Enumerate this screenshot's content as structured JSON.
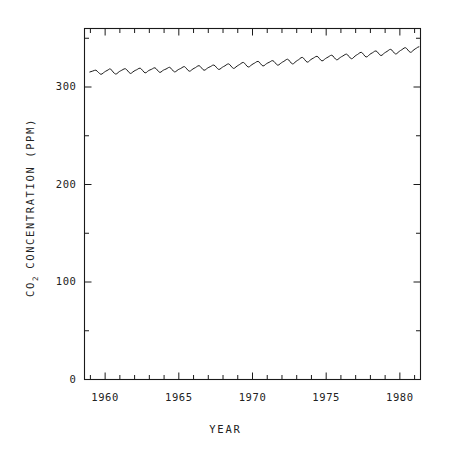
{
  "figure": {
    "background_color": "#ffffff",
    "line_color": "#1a1a1a",
    "frame_color": "#1a1a1a"
  },
  "axis_titles": {
    "y_prefix": "CO",
    "y_subscript": "2",
    "y_suffix": " CONCENTRATION  (PPM)",
    "x": "YEAR"
  },
  "y_ticks": [
    {
      "label": "0",
      "value": 0
    },
    {
      "label": "100",
      "value": 100
    },
    {
      "label": "200",
      "value": 200
    },
    {
      "label": "300",
      "value": 300
    }
  ],
  "y_minor_values": [
    50,
    150,
    250,
    350
  ],
  "x_ticks": [
    {
      "label": "1960",
      "value": 1960
    },
    {
      "label": "1965",
      "value": 1965
    },
    {
      "label": "1970",
      "value": 1970
    },
    {
      "label": "1975",
      "value": 1975
    },
    {
      "label": "1980",
      "value": 1980
    }
  ],
  "x_minor_values": [
    1959,
    1961,
    1962,
    1963,
    1964,
    1966,
    1967,
    1968,
    1969,
    1971,
    1972,
    1973,
    1974,
    1976,
    1977,
    1978,
    1979,
    1981
  ],
  "chart_data": {
    "type": "line",
    "title": "",
    "xlabel": "YEAR",
    "ylabel": "CO2 CONCENTRATION (PPM)",
    "xlim": [
      1958.6,
      1981.4
    ],
    "ylim": [
      0,
      360
    ],
    "grid": false,
    "legend": null,
    "series": [
      {
        "name": "Atmospheric CO2 (Mauna Loa monthly mean)",
        "note": "Monthly mean CO2 concentration showing rising trend with annual seasonal oscillation (~6 ppm peak-to-peak)",
        "x": [
          1958.96,
          1959.13,
          1959.29,
          1959.38,
          1959.46,
          1959.54,
          1959.63,
          1959.71,
          1959.79,
          1959.88,
          1959.96,
          1960.04,
          1960.13,
          1960.21,
          1960.29,
          1960.38,
          1960.46,
          1960.54,
          1960.63,
          1960.71,
          1960.79,
          1960.88,
          1960.96,
          1961.04,
          1961.13,
          1961.21,
          1961.29,
          1961.38,
          1961.46,
          1961.54,
          1961.63,
          1961.71,
          1961.79,
          1961.88,
          1961.96,
          1962.04,
          1962.13,
          1962.21,
          1962.29,
          1962.38,
          1962.46,
          1962.54,
          1962.63,
          1962.71,
          1962.79,
          1962.88,
          1962.96,
          1963.04,
          1963.13,
          1963.21,
          1963.29,
          1963.38,
          1963.46,
          1963.54,
          1963.63,
          1963.71,
          1963.79,
          1963.88,
          1963.96,
          1964.04,
          1964.13,
          1964.21,
          1964.29,
          1964.38,
          1964.46,
          1964.54,
          1964.63,
          1964.71,
          1964.79,
          1964.88,
          1964.96,
          1965.04,
          1965.13,
          1965.21,
          1965.29,
          1965.38,
          1965.46,
          1965.54,
          1965.63,
          1965.71,
          1965.79,
          1965.88,
          1965.96,
          1966.04,
          1966.13,
          1966.21,
          1966.29,
          1966.38,
          1966.46,
          1966.54,
          1966.63,
          1966.71,
          1966.79,
          1966.88,
          1966.96,
          1967.04,
          1967.13,
          1967.21,
          1967.29,
          1967.38,
          1967.46,
          1967.54,
          1967.63,
          1967.71,
          1967.79,
          1967.88,
          1967.96,
          1968.04,
          1968.13,
          1968.21,
          1968.29,
          1968.38,
          1968.46,
          1968.54,
          1968.63,
          1968.71,
          1968.79,
          1968.88,
          1968.96,
          1969.04,
          1969.13,
          1969.21,
          1969.29,
          1969.38,
          1969.46,
          1969.54,
          1969.63,
          1969.71,
          1969.79,
          1969.88,
          1969.96,
          1970.04,
          1970.13,
          1970.21,
          1970.29,
          1970.38,
          1970.46,
          1970.54,
          1970.63,
          1970.71,
          1970.79,
          1970.88,
          1970.96,
          1971.04,
          1971.13,
          1971.21,
          1971.29,
          1971.38,
          1971.46,
          1971.54,
          1971.63,
          1971.71,
          1971.79,
          1971.88,
          1971.96,
          1972.04,
          1972.13,
          1972.21,
          1972.29,
          1972.38,
          1972.46,
          1972.54,
          1972.63,
          1972.71,
          1972.79,
          1972.88,
          1972.96,
          1973.04,
          1973.13,
          1973.21,
          1973.29,
          1973.38,
          1973.46,
          1973.54,
          1973.63,
          1973.71,
          1973.79,
          1973.88,
          1973.96,
          1974.04,
          1974.13,
          1974.21,
          1974.29,
          1974.38,
          1974.46,
          1974.54,
          1974.63,
          1974.71,
          1974.79,
          1974.88,
          1974.96,
          1975.04,
          1975.13,
          1975.21,
          1975.29,
          1975.38,
          1975.46,
          1975.54,
          1975.63,
          1975.71,
          1975.79,
          1975.88,
          1975.96,
          1976.04,
          1976.13,
          1976.21,
          1976.29,
          1976.38,
          1976.46,
          1976.54,
          1976.63,
          1976.71,
          1976.79,
          1976.88,
          1976.96,
          1977.04,
          1977.13,
          1977.21,
          1977.29,
          1977.38,
          1977.46,
          1977.54,
          1977.63,
          1977.71,
          1977.79,
          1977.88,
          1977.96,
          1978.04,
          1978.13,
          1978.21,
          1978.29,
          1978.38,
          1978.46,
          1978.54,
          1978.63,
          1978.71,
          1978.79,
          1978.88,
          1978.96,
          1979.04,
          1979.13,
          1979.21,
          1979.29,
          1979.38,
          1979.46,
          1979.54,
          1979.63,
          1979.71,
          1979.79,
          1979.88,
          1979.96,
          1980.04,
          1980.13,
          1980.21,
          1980.29,
          1980.38,
          1980.46,
          1980.54,
          1980.63,
          1980.71,
          1980.79,
          1980.88,
          1980.96,
          1981.04,
          1981.13,
          1981.21,
          1981.29
        ],
        "y": [
          315.4,
          316.2,
          317.1,
          317.3,
          316.2,
          315.0,
          313.8,
          313.0,
          313.4,
          314.5,
          315.4,
          316.2,
          316.9,
          317.6,
          318.5,
          318.2,
          317.1,
          315.4,
          314.0,
          313.3,
          313.6,
          314.8,
          315.8,
          316.5,
          317.2,
          317.9,
          318.6,
          318.7,
          317.8,
          316.4,
          314.8,
          313.9,
          314.3,
          315.4,
          316.3,
          317.0,
          317.6,
          318.3,
          319.1,
          319.3,
          318.4,
          317.0,
          315.4,
          314.5,
          314.8,
          316.0,
          316.9,
          317.5,
          318.0,
          318.7,
          319.4,
          319.7,
          318.8,
          317.4,
          315.8,
          315.0,
          315.3,
          316.5,
          317.3,
          317.9,
          318.4,
          319.1,
          319.9,
          320.2,
          319.3,
          317.9,
          316.3,
          315.5,
          315.8,
          316.9,
          317.8,
          318.4,
          319.0,
          319.8,
          320.6,
          320.9,
          320.0,
          318.6,
          317.0,
          316.2,
          316.5,
          317.6,
          318.5,
          319.2,
          319.9,
          320.8,
          321.6,
          321.9,
          321.0,
          319.6,
          318.0,
          317.2,
          317.5,
          318.6,
          319.5,
          320.2,
          320.8,
          321.5,
          322.3,
          322.5,
          321.7,
          320.3,
          318.8,
          318.0,
          318.3,
          319.4,
          320.3,
          321.0,
          321.7,
          322.6,
          323.4,
          323.7,
          322.9,
          321.5,
          319.9,
          319.1,
          319.4,
          320.6,
          321.5,
          322.3,
          323.1,
          324.0,
          324.9,
          325.2,
          324.4,
          322.9,
          321.3,
          320.5,
          320.8,
          322.0,
          322.9,
          323.7,
          324.4,
          325.2,
          326.0,
          326.3,
          325.5,
          324.0,
          322.4,
          321.6,
          321.9,
          323.1,
          324.0,
          324.7,
          325.3,
          326.0,
          326.8,
          327.0,
          326.2,
          324.8,
          323.2,
          322.4,
          322.7,
          323.9,
          324.8,
          325.6,
          326.3,
          327.2,
          328.1,
          328.5,
          327.7,
          326.2,
          324.5,
          323.7,
          324.0,
          325.3,
          326.3,
          327.2,
          328.0,
          329.0,
          330.0,
          330.4,
          329.6,
          328.1,
          326.4,
          325.5,
          325.8,
          327.1,
          328.1,
          328.9,
          329.6,
          330.4,
          331.2,
          331.5,
          330.7,
          329.2,
          327.6,
          326.8,
          327.1,
          328.3,
          329.2,
          330.0,
          330.7,
          331.5,
          332.3,
          332.6,
          331.8,
          330.3,
          328.7,
          327.9,
          328.2,
          329.4,
          330.3,
          331.1,
          331.8,
          332.6,
          333.4,
          333.7,
          332.9,
          331.4,
          329.8,
          329.0,
          329.3,
          330.6,
          331.7,
          332.6,
          333.4,
          334.3,
          335.2,
          335.6,
          334.8,
          333.3,
          331.6,
          330.8,
          331.1,
          332.4,
          333.4,
          334.3,
          335.0,
          335.8,
          336.7,
          337.0,
          336.2,
          334.7,
          333.1,
          332.3,
          332.6,
          333.9,
          334.9,
          335.7,
          336.5,
          337.4,
          338.3,
          338.6,
          337.8,
          336.3,
          334.7,
          333.9,
          334.2,
          335.5,
          336.5,
          337.4,
          338.2,
          339.1,
          340.0,
          340.3,
          339.5,
          338.0,
          336.4,
          335.6,
          335.9,
          337.2,
          338.2,
          339.1,
          339.9,
          340.8,
          341.2
        ]
      }
    ]
  },
  "ghost_text": {
    "visible": true,
    "content": " "
  }
}
